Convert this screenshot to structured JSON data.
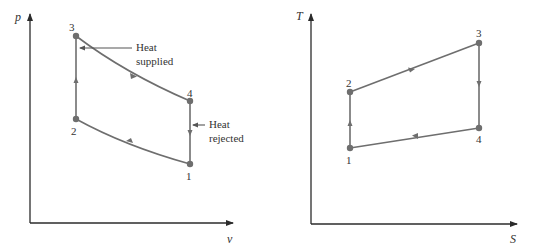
{
  "colors": {
    "axis": "#2b2b2b",
    "curve": "#6e6e6e",
    "point": "#6e6e6e",
    "text": "#333333"
  },
  "pv_diagram": {
    "y_axis_label": "p",
    "x_axis_label": "v",
    "points": [
      {
        "id": "1",
        "label": "1"
      },
      {
        "id": "2",
        "label": "2"
      },
      {
        "id": "3",
        "label": "3"
      },
      {
        "id": "4",
        "label": "4"
      }
    ],
    "annotations": {
      "heat_supplied_line1": "Heat",
      "heat_supplied_line2": "supplied",
      "heat_rejected_line1": "Heat",
      "heat_rejected_line2": "rejected"
    }
  },
  "ts_diagram": {
    "y_axis_label": "T",
    "x_axis_label": "S",
    "points": [
      {
        "id": "1",
        "label": "1"
      },
      {
        "id": "2",
        "label": "2"
      },
      {
        "id": "3",
        "label": "3"
      },
      {
        "id": "4",
        "label": "4"
      }
    ]
  }
}
